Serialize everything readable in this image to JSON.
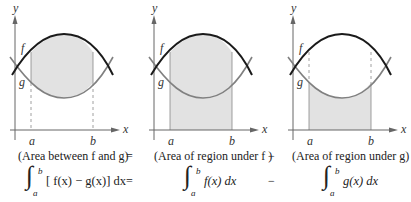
{
  "panels": [
    {
      "id": "between",
      "shading": "between f and g",
      "dashes_full": true,
      "labels": {
        "y": "y",
        "x": "x",
        "f": "f",
        "g": "g",
        "a": "a",
        "b": "b"
      }
    },
    {
      "id": "under-f",
      "shading": "under f",
      "labels": {
        "y": "y",
        "x": "x",
        "f": "f",
        "g": "g",
        "a": "a",
        "b": "b"
      }
    },
    {
      "id": "under-g",
      "shading": "under g",
      "labels": {
        "y": "y",
        "x": "x",
        "f": "f",
        "g": "g",
        "a": "a",
        "b": "b"
      }
    }
  ],
  "colors": {
    "f_curve": "#1a1a1a",
    "g_curve": "#808080",
    "shade": "#e2e2e2",
    "axis": "#666666"
  },
  "captions": {
    "c1": "(Area between f and g)",
    "eq1": "=",
    "c2": "(Area of region under f )",
    "op2": "−",
    "c3": "(Area of region under g)"
  },
  "integrals": {
    "upper": "b",
    "lower": "a",
    "i1": "[ f(x) − g(x)] dx",
    "eq": "=",
    "i2": "f(x) dx",
    "op": "−",
    "i3": "g(x) dx"
  }
}
